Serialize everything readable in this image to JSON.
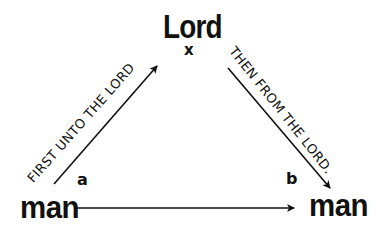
{
  "diagram": {
    "nodes": {
      "top": {
        "label": "Lord",
        "variable": "x"
      },
      "bottom_left": {
        "label": "man",
        "variable": "a"
      },
      "bottom_right": {
        "label": "man",
        "variable": "b"
      }
    },
    "edges": {
      "left": {
        "from": "bottom_left",
        "to": "top",
        "label": "FIRST UNTO THE LORD"
      },
      "right": {
        "from": "top",
        "to": "bottom_right",
        "label": "THEN FROM THE LORD."
      },
      "bottom": {
        "from": "bottom_left",
        "to": "bottom_right",
        "label": ""
      }
    },
    "colors": {
      "ink": "#111111",
      "background": "#ffffff"
    }
  }
}
